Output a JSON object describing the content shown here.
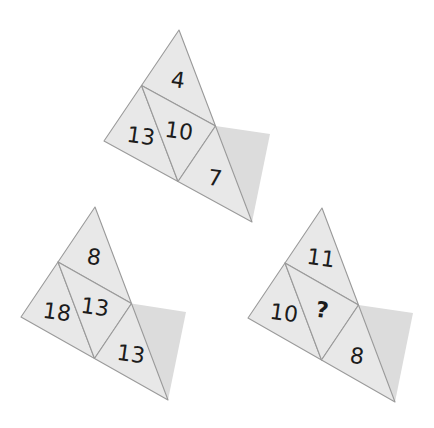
{
  "puzzle": {
    "colors": {
      "background": "#ffffff",
      "cell_fill": "#e8e8e8",
      "cell_stroke": "#9a9a9a",
      "shadow_fill": "#dcdcdc",
      "text": "#1c1c1c"
    },
    "figures": [
      {
        "name": "figure-1",
        "top": "4",
        "left": "13",
        "center": "10",
        "right": "7"
      },
      {
        "name": "figure-2",
        "top": "8",
        "left": "18",
        "center": "13",
        "right": "13"
      },
      {
        "name": "figure-3",
        "top": "11",
        "left": "10",
        "center": "?",
        "right": "8"
      }
    ]
  }
}
